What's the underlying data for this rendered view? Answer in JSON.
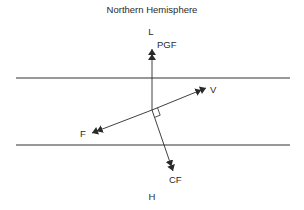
{
  "diagram": {
    "title": "Northern Hemisphere",
    "pressure": {
      "low_label": "L",
      "high_label": "H"
    },
    "isobars": [
      {
        "name": "upper-isobar",
        "x1": 16,
        "x2": 290,
        "y": 78
      },
      {
        "name": "lower-isobar",
        "x1": 16,
        "x2": 290,
        "y": 145
      }
    ],
    "origin": {
      "x": 152,
      "y": 110
    },
    "vectors": [
      {
        "name": "pgf",
        "label": "PGF",
        "tip": {
          "x": 152,
          "y": 49
        },
        "label_pos": {
          "x": 157,
          "y": 48
        }
      },
      {
        "name": "velocity",
        "label": "V",
        "tip": {
          "x": 206,
          "y": 88
        },
        "label_pos": {
          "x": 210,
          "y": 93
        }
      },
      {
        "name": "friction",
        "label": "F",
        "tip": {
          "x": 92,
          "y": 133
        },
        "label_pos": {
          "x": 80,
          "y": 137
        }
      },
      {
        "name": "coriolis",
        "label": "CF",
        "tip": {
          "x": 173,
          "y": 171
        },
        "label_pos": {
          "x": 169,
          "y": 183
        }
      }
    ],
    "colors": {
      "line": "#2a2a2a",
      "isobar": "#333333",
      "background": "#ffffff"
    }
  }
}
